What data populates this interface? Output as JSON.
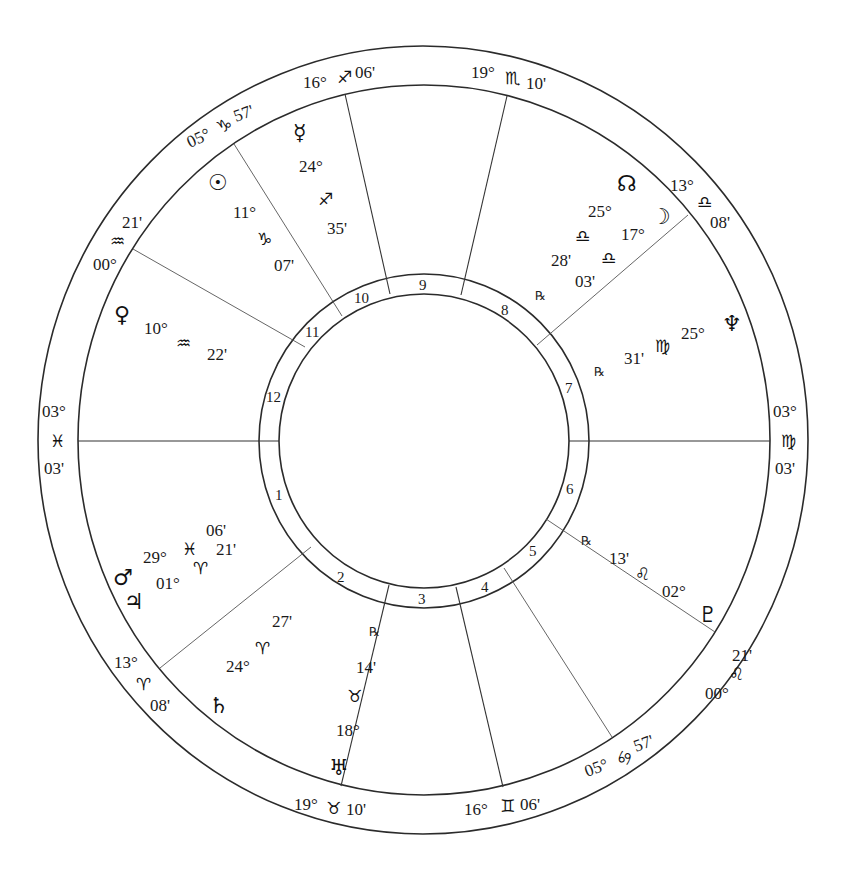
{
  "chart": {
    "type": "natal-wheel",
    "colors": {
      "line": "#2b2b2b",
      "text": "#1a1a1a",
      "background": "#ffffff"
    }
  },
  "cusps": [
    {
      "house": "1",
      "deg": "03°",
      "sign": "♓",
      "min": "03'"
    },
    {
      "house": "2",
      "deg": "13°",
      "sign": "♈",
      "min": "08'"
    },
    {
      "house": "3",
      "deg": "19°",
      "sign": "♉",
      "min": "10'"
    },
    {
      "house": "4",
      "deg": "16°",
      "sign": "♊",
      "min": "06'"
    },
    {
      "house": "5",
      "deg": "05°",
      "sign": "♋",
      "min": "57'"
    },
    {
      "house": "6",
      "deg": "00°",
      "sign": "♌",
      "min": "21'"
    },
    {
      "house": "7",
      "deg": "03°",
      "sign": "♍",
      "min": "03'"
    },
    {
      "house": "8",
      "deg": "13°",
      "sign": "♎",
      "min": "08'"
    },
    {
      "house": "9",
      "deg": "19°",
      "sign": "♏",
      "min": "10'"
    },
    {
      "house": "10",
      "deg": "16°",
      "sign": "♐",
      "min": "06'"
    },
    {
      "house": "11",
      "deg": "05°",
      "sign": "♑",
      "min": "57'"
    },
    {
      "house": "12",
      "deg": "00°",
      "sign": "♒",
      "min": "21'"
    }
  ],
  "house_numbers": [
    "1",
    "2",
    "3",
    "4",
    "5",
    "6",
    "7",
    "8",
    "9",
    "10",
    "11",
    "12"
  ],
  "planets": [
    {
      "name": "Sun",
      "glyph": "☉",
      "deg": "11°",
      "sign": "♑",
      "min": "07'",
      "retro": ""
    },
    {
      "name": "Mercury",
      "glyph": "☿",
      "deg": "24°",
      "sign": "♐",
      "min": "35'",
      "retro": ""
    },
    {
      "name": "Venus",
      "glyph": "♀",
      "deg": "10°",
      "sign": "♒",
      "min": "22'",
      "retro": ""
    },
    {
      "name": "Mars",
      "glyph": "♂",
      "deg": "29°",
      "sign": "♓",
      "min": "06'",
      "retro": ""
    },
    {
      "name": "Jupiter",
      "glyph": "♃",
      "deg": "01°",
      "sign": "♈",
      "min": "21'",
      "retro": ""
    },
    {
      "name": "Saturn",
      "glyph": "♄",
      "deg": "24°",
      "sign": "♈",
      "min": "27'",
      "retro": ""
    },
    {
      "name": "Uranus",
      "glyph": "♅",
      "deg": "18°",
      "sign": "♉",
      "min": "14'",
      "retro": "℞"
    },
    {
      "name": "Pluto",
      "glyph": "♇",
      "deg": "02°",
      "sign": "♌",
      "min": "13'",
      "retro": "℞"
    },
    {
      "name": "Neptune",
      "glyph": "♆",
      "deg": "25°",
      "sign": "♍",
      "min": "31'",
      "retro": "℞"
    },
    {
      "name": "Moon",
      "glyph": "☽",
      "deg": "17°",
      "sign": "♎",
      "min": "03'",
      "retro": ""
    },
    {
      "name": "North Node",
      "glyph": "☊",
      "deg": "25°",
      "sign": "♎",
      "min": "28'",
      "retro": "℞"
    }
  ]
}
